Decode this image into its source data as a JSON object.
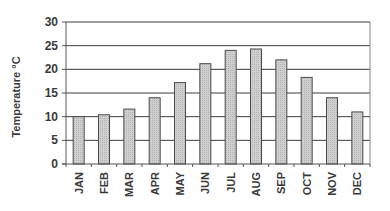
{
  "chart_data": {
    "type": "bar",
    "title": "",
    "xlabel": "",
    "ylabel": "Temperature °C",
    "categories": [
      "JAN",
      "FEB",
      "MAR",
      "APR",
      "MAY",
      "JUN",
      "JUL",
      "AUG",
      "SEP",
      "OCT",
      "NOV",
      "DEC"
    ],
    "values": [
      10,
      10.4,
      11.6,
      14,
      17.2,
      21.2,
      24,
      24.3,
      22,
      18.3,
      14,
      11
    ],
    "ylim": [
      0,
      30
    ],
    "yticks": [
      0,
      5,
      10,
      15,
      20,
      25,
      30
    ],
    "grid": true,
    "legend": null,
    "colors": {
      "bar_fill": "#c9c9c9",
      "bar_stroke": "#4a4a4a",
      "grid": "#3c3c3c",
      "axis": "#555555"
    }
  }
}
